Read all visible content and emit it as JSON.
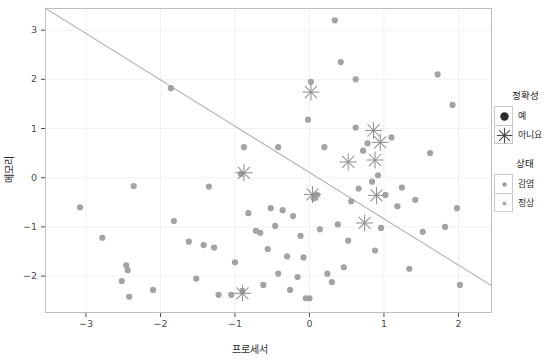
{
  "chart_data": {
    "type": "scatter",
    "title": "",
    "xlabel": "프로세서",
    "ylabel": "메모리",
    "xlim": [
      -3.55,
      2.45
    ],
    "ylim": [
      -2.75,
      3.45
    ],
    "xticks": [
      -3,
      -2,
      -1,
      0,
      1,
      2
    ],
    "xtick_labels": [
      "-3",
      "-2",
      "-1",
      "0",
      "1",
      "2"
    ],
    "yticks": [
      -2,
      -1,
      0,
      1,
      2,
      3
    ],
    "ytick_labels": [
      "-2",
      "-1",
      "0",
      "1",
      "2",
      "3"
    ],
    "grid": true,
    "grid_color": "#f2f2f2",
    "panel_background": "#ffffff",
    "panel_border_color": "#bfbfbf",
    "point_color": "#9e9e9e",
    "star_color": "#8c8c8c",
    "boundary_line": {
      "color": "#b9b9b9",
      "from": [
        -3.55,
        3.45
      ],
      "to": [
        2.45,
        -2.2
      ],
      "label": "decision-boundary"
    },
    "legend_position": "right",
    "legends": [
      {
        "name": "accuracy-legend",
        "title": "정확성",
        "entries": [
          {
            "label": "예",
            "marker": "filled-circle"
          },
          {
            "label": "아니요",
            "marker": "asterisk-star"
          }
        ]
      },
      {
        "name": "status-legend",
        "title": "상태",
        "entries": [
          {
            "label": "감염",
            "marker": "small-gray-dot"
          },
          {
            "label": "정상",
            "marker": "small-gray-dot"
          }
        ]
      }
    ],
    "series": [
      {
        "name": "정상",
        "marker": "circle",
        "color": "#9e9e9e",
        "points": [
          [
            -3.08,
            -0.6
          ],
          [
            -2.78,
            -1.22
          ],
          [
            -2.52,
            -2.1
          ],
          [
            -2.46,
            -1.78
          ],
          [
            -2.44,
            -1.88
          ],
          [
            -2.42,
            -2.42
          ],
          [
            -2.36,
            -0.17
          ],
          [
            -2.1,
            -2.28
          ],
          [
            -1.86,
            1.82
          ],
          [
            -1.82,
            -0.88
          ],
          [
            -1.62,
            -1.3
          ],
          [
            -1.52,
            -2.05
          ],
          [
            -1.42,
            -1.37
          ],
          [
            -1.28,
            -1.42
          ],
          [
            -1.22,
            -2.38
          ],
          [
            -1.05,
            -2.38
          ],
          [
            -1.0,
            -1.72
          ],
          [
            -0.92,
            0.08
          ],
          [
            -0.88,
            0.62
          ],
          [
            -0.82,
            -0.72
          ],
          [
            -0.72,
            -1.08
          ],
          [
            -0.66,
            -1.12
          ],
          [
            -0.62,
            -2.18
          ],
          [
            -0.56,
            -1.45
          ],
          [
            -0.52,
            -0.62
          ],
          [
            -0.46,
            -0.98
          ],
          [
            -0.42,
            -1.95
          ],
          [
            -0.36,
            -0.66
          ],
          [
            -0.3,
            -1.6
          ],
          [
            -0.26,
            -2.28
          ],
          [
            -0.22,
            -0.78
          ],
          [
            -0.16,
            -2.02
          ],
          [
            -0.12,
            -1.18
          ],
          [
            -0.08,
            -1.62
          ],
          [
            -0.05,
            -2.45
          ],
          [
            0.0,
            -2.45
          ],
          [
            0.02,
            1.95
          ],
          [
            0.06,
            -0.42
          ],
          [
            0.1,
            -0.35
          ],
          [
            0.14,
            -1.05
          ],
          [
            0.2,
            0.62
          ],
          [
            0.24,
            -1.95
          ],
          [
            0.3,
            -2.12
          ],
          [
            0.34,
            3.2
          ],
          [
            0.38,
            -0.95
          ],
          [
            0.42,
            2.35
          ],
          [
            0.46,
            -1.82
          ],
          [
            0.52,
            -1.28
          ],
          [
            0.56,
            -0.48
          ],
          [
            0.62,
            1.02
          ],
          [
            0.66,
            -0.22
          ],
          [
            0.72,
            0.55
          ],
          [
            0.78,
            0.7
          ],
          [
            0.84,
            -0.08
          ],
          [
            0.88,
            -1.48
          ],
          [
            0.92,
            0.05
          ],
          [
            0.96,
            -1.02
          ],
          [
            1.02,
            -0.35
          ],
          [
            1.1,
            0.82
          ],
          [
            1.18,
            -0.58
          ],
          [
            1.24,
            -0.2
          ],
          [
            1.34,
            -1.85
          ],
          [
            1.42,
            -0.45
          ],
          [
            1.52,
            -1.1
          ],
          [
            1.62,
            0.5
          ],
          [
            1.72,
            2.1
          ],
          [
            1.82,
            -1.0
          ],
          [
            1.92,
            1.48
          ],
          [
            1.98,
            -0.62
          ],
          [
            2.02,
            -2.18
          ],
          [
            -0.42,
            0.62
          ],
          [
            -1.35,
            -0.18
          ],
          [
            0.62,
            2.0
          ],
          [
            -0.02,
            1.18
          ],
          [
            -0.9,
            -2.3
          ]
        ]
      },
      {
        "name": "아니요",
        "marker": "asterisk",
        "color": "#8c8c8c",
        "points": [
          [
            0.02,
            1.74
          ],
          [
            -0.88,
            0.1
          ],
          [
            0.86,
            0.96
          ],
          [
            0.95,
            0.72
          ],
          [
            0.52,
            0.32
          ],
          [
            0.04,
            -0.34
          ],
          [
            0.9,
            -0.36
          ],
          [
            0.74,
            -0.92
          ],
          [
            -0.9,
            -2.35
          ],
          [
            0.88,
            0.36
          ]
        ]
      }
    ]
  }
}
